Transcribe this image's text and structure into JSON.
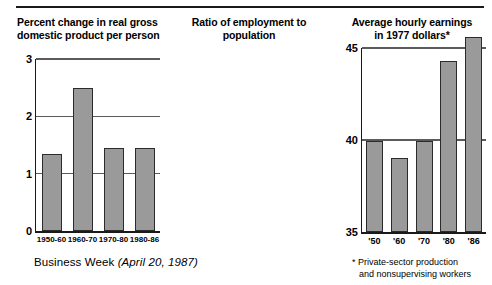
{
  "source_note": {
    "publication": "Business Week",
    "date": "(April 20, 1987)"
  },
  "footnote": {
    "line1": "* Private-sector production",
    "line2": "and nonsupervising workers"
  },
  "colors": {
    "bar_fill": "#9a9a9a",
    "bar_stroke": "#2b2b2b",
    "gridline": "#5b5b5b",
    "axis": "#1a1a1a",
    "background": "#ffffff"
  },
  "chart_data": [
    {
      "type": "bar",
      "title": "Percent change in real gross domestic product per person",
      "title_line1": "Percent change in real gross",
      "title_line2": "domestic product per person",
      "categories": [
        "1950-60",
        "1960-70",
        "1970-80",
        "1980-86"
      ],
      "values": [
        1.35,
        2.5,
        1.45,
        1.45
      ],
      "xlabel": "",
      "ylabel": "",
      "ylim": [
        0,
        3
      ],
      "yticks": [
        0,
        1,
        2,
        3
      ],
      "ytick_labels": [
        "0",
        "1",
        "2",
        "3"
      ],
      "gridlines": [
        1,
        2,
        3
      ],
      "grid": true,
      "legend": "none"
    },
    {
      "type": "bar",
      "title": "Ratio of employment to population",
      "title_line1": "Ratio of employment to",
      "title_line2": "population",
      "categories": [
        "'50",
        "'60",
        "'70",
        "'80",
        "'86"
      ],
      "values": [
        39.95,
        39.0,
        39.95,
        44.3,
        45.6
      ],
      "xlabel": "",
      "ylabel": "",
      "ylim": [
        35,
        45
      ],
      "yticks": [
        35,
        40,
        45
      ],
      "ytick_labels": [
        "35",
        "40",
        "45"
      ],
      "gridlines": [
        40,
        45
      ],
      "grid": true,
      "legend": "none"
    },
    {
      "type": "bar",
      "title": "Average hourly earnings in 1977 dollars*",
      "title_line1": "Average hourly earnings",
      "title_line2": "in 1977 dollars*",
      "categories": [
        "'50",
        "'60",
        "'70",
        "'80",
        "'86"
      ],
      "values": [
        3.37,
        4.17,
        5.06,
        4.85,
        4.94
      ],
      "xlabel": "",
      "ylabel": "",
      "ylim": [
        2,
        5
      ],
      "yticks": [
        2,
        3,
        4,
        5
      ],
      "ytick_labels": [
        "2",
        "3",
        "4",
        "5"
      ],
      "gridlines": [
        3,
        4,
        5
      ],
      "grid": true,
      "legend": "none"
    }
  ]
}
